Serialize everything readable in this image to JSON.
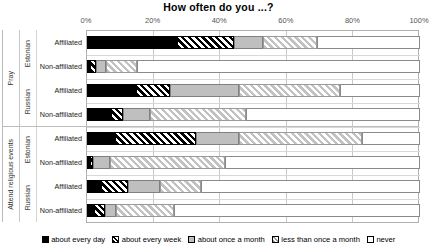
{
  "chart_data": {
    "type": "bar",
    "orientation": "horizontal",
    "stacked": true,
    "stacked_percent": true,
    "title": "How often do you ...?",
    "xlabel": "",
    "ylabel": "",
    "xlim": [
      0,
      100
    ],
    "xticks": [
      0,
      20,
      40,
      60,
      80,
      100
    ],
    "xtick_labels": [
      "0%",
      "20%",
      "40%",
      "60%",
      "80%",
      "100%"
    ],
    "grid": true,
    "legend_position": "bottom",
    "series": [
      {
        "name": "about every day",
        "values": [
          27.0,
          0.9,
          14.8,
          7.2,
          8.4,
          1.0,
          4.3,
          2.0
        ]
      },
      {
        "name": "about every week",
        "values": [
          17.0,
          1.7,
          10.0,
          3.6,
          24.4,
          0.8,
          7.9,
          3.5
        ]
      },
      {
        "name": "about once a month",
        "values": [
          9.0,
          3.1,
          20.9,
          8.0,
          12.7,
          5.0,
          9.6,
          3.3
        ]
      },
      {
        "name": "less than once a month",
        "values": [
          16.0,
          9.3,
          30.3,
          29.0,
          37.0,
          34.5,
          12.5,
          17.2
        ]
      },
      {
        "name": "never",
        "values": [
          31.0,
          85.0,
          24.0,
          52.2,
          17.5,
          58.7,
          65.7,
          74.0
        ]
      }
    ],
    "categories": [
      "Pray / Estonian / Affiliated",
      "Pray / Estonian / Non-affiliated",
      "Pray / Russian / Affiliated",
      "Pray / Russian / Non-affiliated",
      "Attend religious events / Estonian / Affiliated",
      "Attend religious events / Estonian / Non-affiliated",
      "Attend religious events / Russian / Affiliated",
      "Attend religious events / Russian / Non-affiliated"
    ],
    "colors": [
      "#000000",
      "#000000",
      "#bfbfbf",
      "#c2c2c2",
      "#ffffff"
    ]
  },
  "axis": {
    "tick_labels": [
      "0%",
      "20%",
      "40%",
      "60%",
      "80%",
      "100%"
    ]
  },
  "groups": [
    {
      "label": "Pray",
      "subgroups": [
        {
          "label": "Estonian",
          "rows": [
            {
              "label": "Affiliated",
              "segments": [
                27.0,
                17.0,
                9.0,
                16.0,
                31.0
              ]
            },
            {
              "label": "Non-affiliated",
              "segments": [
                0.9,
                1.7,
                3.1,
                9.3,
                85.0
              ]
            }
          ]
        },
        {
          "label": "Russian",
          "rows": [
            {
              "label": "Affiliated",
              "segments": [
                14.8,
                10.0,
                20.9,
                30.3,
                24.0
              ]
            },
            {
              "label": "Non-affiliated",
              "segments": [
                7.2,
                3.6,
                8.0,
                29.0,
                52.2
              ]
            }
          ]
        }
      ]
    },
    {
      "label": "Attend religious events",
      "subgroups": [
        {
          "label": "Estonian",
          "rows": [
            {
              "label": "Affiliated",
              "segments": [
                8.4,
                24.4,
                12.7,
                37.0,
                17.5
              ]
            },
            {
              "label": "Non-affiliated",
              "segments": [
                1.0,
                0.8,
                5.0,
                34.5,
                58.7
              ]
            }
          ]
        },
        {
          "label": "Russian",
          "rows": [
            {
              "label": "Affiliated",
              "segments": [
                4.3,
                7.9,
                9.6,
                12.5,
                65.7
              ]
            },
            {
              "label": "Non-affiliated",
              "segments": [
                2.0,
                3.5,
                3.3,
                17.2,
                74.0
              ]
            }
          ]
        }
      ]
    }
  ],
  "legend": {
    "items": [
      "about every day",
      "about every week",
      "about once a month",
      "less than once a month",
      "never"
    ]
  }
}
